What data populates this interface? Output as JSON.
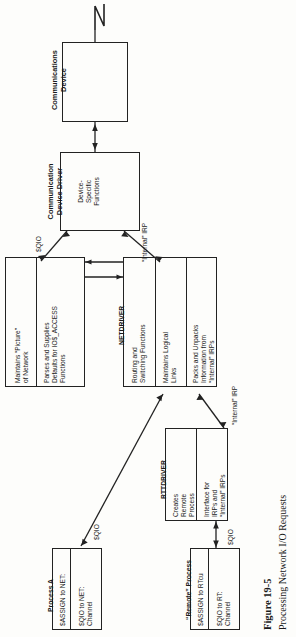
{
  "figure": {
    "number": "Figure 19-5",
    "caption": "Processing Network I/O Requests"
  },
  "nodes": {
    "comm_device": {
      "title": "Communications\nDevice",
      "title_line1": "Communications",
      "title_line2": "Device"
    },
    "comm_driver": {
      "title_line1": "Communication",
      "title_line2": "Device Driver",
      "cells": [
        "Device-\nSpecific\nFunctions"
      ]
    },
    "left_support": {
      "cells": [
        "Maintains “Picture”\nof Network",
        "Parses and Supplies\nDefaults for IO$_ACCESS\nFunctions"
      ]
    },
    "netdriver": {
      "title": "NETDRIVER",
      "cells": [
        "Routing and\nSwitching Functions",
        "Maintains Logical\nLinks",
        "Packs and Unpacks\nInformation from\n“Internal” IRPs"
      ]
    },
    "rttdriver": {
      "title": "RTTDRIVER",
      "cells": [
        "Creates\nRemote\nProcess",
        "Interface for\nIRPs and\n“Internal” IRPs"
      ]
    },
    "process_a": {
      "title": "Process A",
      "cells": [
        "$ASSIGN to NET:",
        "$QIO to NET:\nChannel"
      ]
    },
    "remote_process": {
      "title": "“Remote” Process",
      "cells": [
        "$ASSIGN to RTcu",
        "$QIO to RT:\nChannel"
      ]
    }
  },
  "edge_labels": {
    "qio_driver": "$QIO",
    "irp_driver": "“Internal” IRP",
    "qio_process_a": "$QIO",
    "irp_rtt": "“Internal” IRP",
    "qio_remote": "$QIO"
  },
  "colors": {
    "ink": "#222222",
    "paper": "#fdfdfb"
  }
}
